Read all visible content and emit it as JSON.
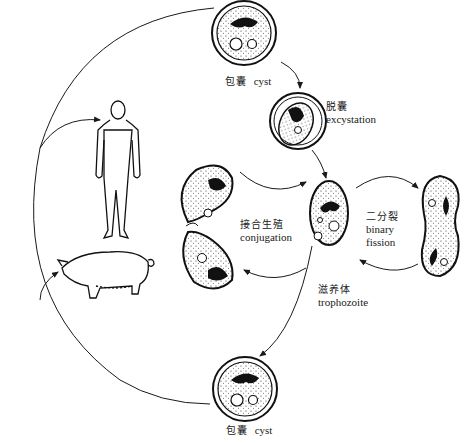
{
  "diagram": {
    "type": "life-cycle",
    "stages": {
      "cyst_top": {
        "zh": "包囊",
        "en": "cyst"
      },
      "excystation": {
        "zh": "脱囊",
        "en": "excystation"
      },
      "trophozoite": {
        "zh": "滋养体",
        "en": "trophozoite"
      },
      "conjugation": {
        "zh": "接合生殖",
        "en": "conjugation"
      },
      "binary_fission": {
        "zh": "二分裂",
        "en_line1": "binary",
        "en_line2": "fission"
      },
      "cyst_bottom": {
        "zh": "包囊",
        "en": "cyst"
      }
    },
    "hosts": [
      {
        "name": "human-figure"
      },
      {
        "name": "pig-figure"
      }
    ],
    "colors": {
      "ink": "#1a1a1a",
      "background": "#ffffff"
    }
  }
}
